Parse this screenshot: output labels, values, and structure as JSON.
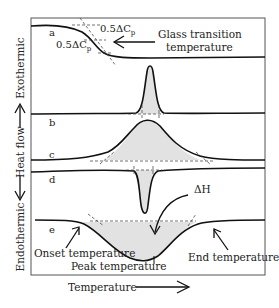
{
  "diagram": {
    "type": "DSC thermogram schematic",
    "y_axis": {
      "top_label": "Exothermic",
      "middle_label": "Heat flow",
      "bottom_label": "Endothermic"
    },
    "x_axis": {
      "label": "Temperature"
    },
    "curves": [
      {
        "id": "a",
        "label": "a",
        "event": "glass transition (step)"
      },
      {
        "id": "b",
        "label": "b",
        "event": "sharp exothermic peak"
      },
      {
        "id": "c",
        "label": "c",
        "event": "broad exothermic peak"
      },
      {
        "id": "d",
        "label": "d",
        "event": "sharp endothermic peak"
      },
      {
        "id": "e",
        "label": "e",
        "event": "broad endothermic peak"
      }
    ],
    "annotations": {
      "cp_upper": "0.5ΔC",
      "cp_lower": "0.5ΔC",
      "cp_sub": "p",
      "glass_transition_line1": "Glass transition",
      "glass_transition_line2": "temperature",
      "enthalpy": "ΔH",
      "onset": "Onset temperature",
      "peak": "Peak temperature",
      "end": "End temperature"
    },
    "colors": {
      "line": "#111111",
      "shade": "#e2e2e2",
      "frame": "#555555"
    }
  }
}
